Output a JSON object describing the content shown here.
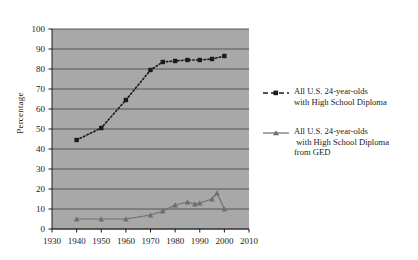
{
  "chart_data": {
    "type": "line",
    "title": "",
    "xlabel": "",
    "ylabel": "Percentage",
    "xlim": [
      1930,
      2010
    ],
    "ylim": [
      0,
      100
    ],
    "grid": true,
    "legend_position": "right",
    "xticks": [
      1930,
      1940,
      1950,
      1960,
      1970,
      1980,
      1990,
      2000,
      2010
    ],
    "yticks": [
      0,
      10,
      20,
      30,
      40,
      50,
      60,
      70,
      80,
      90,
      100
    ],
    "plot_background": "#a8a8a8",
    "gridline_color": "#4a4a4a",
    "series": [
      {
        "name": "All U.S. 24-year-olds with High School Diploma",
        "legend_line1": "All U.S. 24-year-olds",
        "legend_line2": "with High School Diploma",
        "legend_line3": "",
        "marker": "square",
        "linestyle": "dotted",
        "color": "#1a1a1a",
        "x": [
          1940,
          1950,
          1960,
          1970,
          1975,
          1980,
          1985,
          1990,
          1995,
          2000
        ],
        "values": [
          44.5,
          50.5,
          64.5,
          79.5,
          83.5,
          84,
          84.5,
          84.5,
          85,
          86.5
        ]
      },
      {
        "name": "All U.S. 24-year-olds with High School Diploma from GED",
        "legend_line1": "All U.S. 24-year-olds",
        "legend_line2": " with High School Diploma",
        "legend_line3": "from GED",
        "marker": "triangle",
        "linestyle": "solid",
        "color": "#6e6e6e",
        "x": [
          1940,
          1950,
          1960,
          1970,
          1975,
          1980,
          1985,
          1988,
          1990,
          1995,
          1997,
          2000
        ],
        "values": [
          5,
          5,
          5,
          7,
          9,
          12,
          13.5,
          12.5,
          13,
          15,
          18,
          10
        ]
      }
    ]
  },
  "axis": {
    "ylabel": "Percentage",
    "yticks": [
      "100",
      "90",
      "80",
      "70",
      "60",
      "50",
      "40",
      "30",
      "20",
      "10",
      "0"
    ],
    "xticks": [
      "1930",
      "1940",
      "1950",
      "1960",
      "1970",
      "1980",
      "1990",
      "2000",
      "2010"
    ]
  }
}
